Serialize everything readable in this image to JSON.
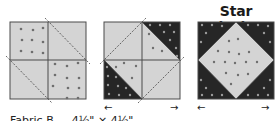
{
  "title": "Star Block 2",
  "caption": "Fabric B — 4½\" × 4½\"",
  "colors": {
    "light": "#d4d4d4",
    "dark": "#262626",
    "outline": "#4a4a4a",
    "dot_on_light": "#6e6e6e",
    "dot_on_dark": "#9a9a9a",
    "dashed_line": "#444444"
  },
  "blocks": [
    {
      "name": "step-1",
      "description": "Four-patch with diagonal dashed cut lines on two squares"
    },
    {
      "name": "step-2",
      "description": "Corner triangles flipped to dark fabric"
    },
    {
      "name": "step-3",
      "description": "Finished square-in-a-square star block"
    }
  ],
  "arrows": {
    "left": "←",
    "right": "→"
  }
}
